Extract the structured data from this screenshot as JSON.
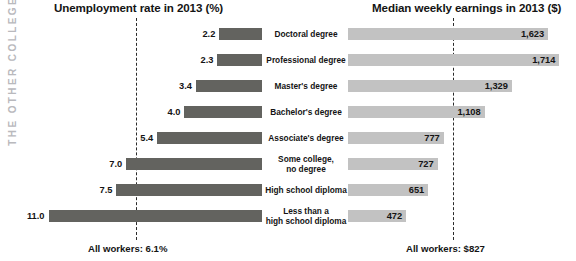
{
  "spine": {
    "label": "THE OTHER COLLEGE"
  },
  "left_chart": {
    "title": "Unemployment rate in 2013 (%)",
    "footer": "All workers: 6.1%"
  },
  "right_chart": {
    "title": "Median weekly earnings in 2013 ($)",
    "footer": "All workers: $827"
  },
  "categories": [
    "Doctoral degree",
    "Professional degree",
    "Master's degree",
    "Bachelor's degree",
    "Associate's degree",
    "Some college,\nno degree",
    "High school diploma",
    "Less than a\nhigh school diploma"
  ],
  "unemployment_labels": [
    "2.2",
    "2.3",
    "3.4",
    "4.0",
    "5.4",
    "7.0",
    "7.5",
    "11.0"
  ],
  "earnings_labels": [
    "1,623",
    "1,714",
    "1,329",
    "1,108",
    "777",
    "727",
    "651",
    "472"
  ],
  "colors": {
    "unemployment_bar": "#63635f",
    "earnings_bar": "#c2c2c2",
    "average_line": "#2b2b2b",
    "spine_text": "#b9b9bd",
    "text": "#141414"
  },
  "chart_data": [
    {
      "type": "bar",
      "title": "Unemployment rate in 2013 (%)",
      "orientation": "horizontal",
      "direction": "right-to-left",
      "xlabel": "Unemployment rate (%)",
      "ylabel": "",
      "categories": [
        "Doctoral degree",
        "Professional degree",
        "Master's degree",
        "Bachelor's degree",
        "Associate's degree",
        "Some college, no degree",
        "High school diploma",
        "Less than a high school diploma"
      ],
      "values": [
        2.2,
        2.3,
        3.4,
        4.0,
        5.4,
        7.0,
        7.5,
        11.0
      ],
      "xlim": [
        0,
        11.8
      ],
      "grid": false,
      "legend": "none",
      "annotations": [
        {
          "text": "All workers: 6.1%",
          "value": 6.1,
          "style": "dashed vertical reference line"
        }
      ]
    },
    {
      "type": "bar",
      "title": "Median weekly earnings in 2013 ($)",
      "orientation": "horizontal",
      "direction": "left-to-right",
      "xlabel": "Median weekly earnings ($)",
      "ylabel": "",
      "categories": [
        "Doctoral degree",
        "Professional degree",
        "Master's degree",
        "Bachelor's degree",
        "Associate's degree",
        "Some college, no degree",
        "High school diploma",
        "Less than a high school diploma"
      ],
      "values": [
        1623,
        1714,
        1329,
        1108,
        777,
        727,
        651,
        472
      ],
      "xlim": [
        0,
        1800
      ],
      "grid": false,
      "legend": "none",
      "annotations": [
        {
          "text": "All workers: $827",
          "value": 827,
          "style": "dashed vertical reference line"
        }
      ]
    }
  ]
}
